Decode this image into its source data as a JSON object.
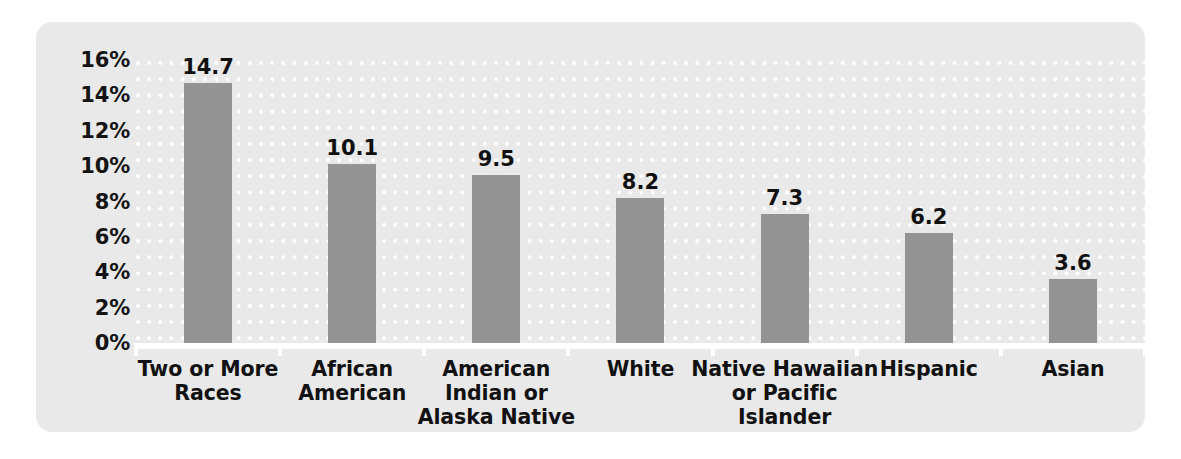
{
  "chart_data": {
    "type": "bar",
    "title": "",
    "subtitle": "",
    "xlabel": "",
    "ylabel": "",
    "orientation": "vertical",
    "grid": "dotted-horizontal",
    "legend": "none",
    "ylim": [
      0,
      16
    ],
    "ytick_step": 2,
    "ytick_labels": [
      "16%",
      "14%",
      "12%",
      "10%",
      "8%",
      "6%",
      "4%",
      "2%",
      "0%"
    ],
    "ytick_values": [
      16,
      14,
      12,
      10,
      8,
      6,
      4,
      2,
      0
    ],
    "value_label_format": "one-decimal",
    "unit": "percent",
    "categories": [
      "Two or More Races",
      "African American",
      "American Indian or Alaska Native",
      "White",
      "Native Hawaiian or Pacific Islander",
      "Hispanic",
      "Asian"
    ],
    "category_lines": [
      [
        "Two or More",
        "Races"
      ],
      [
        "African",
        "American"
      ],
      [
        "American",
        "Indian or",
        "Alaska Native"
      ],
      [
        "White"
      ],
      [
        "Native Hawaiian",
        "or Pacific Islander"
      ],
      [
        "Hispanic"
      ],
      [
        "Asian"
      ]
    ],
    "values": [
      14.7,
      10.1,
      9.5,
      8.2,
      7.3,
      6.2,
      3.6
    ],
    "value_labels": [
      "14.7",
      "10.1",
      "9.5",
      "8.2",
      "7.3",
      "6.2",
      "3.6"
    ],
    "colors": {
      "bar": "#939393",
      "panel_background": "#e9e9e9",
      "figure_background": "#ffffff",
      "gridline": "#ffffff",
      "axis_line": "#ffffff",
      "text": "#111111"
    }
  }
}
